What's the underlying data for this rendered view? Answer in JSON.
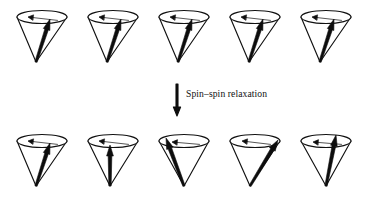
{
  "figure": {
    "background_color": "#ffffff",
    "ink_color": "#111111",
    "width": 378,
    "height": 200
  },
  "transition": {
    "label": "Spin–spin relaxation",
    "arrow_icon": "down-arrow-icon",
    "arrow_direction": "down",
    "arrow_x": 177,
    "arrow_y_start": 84,
    "arrow_y_end": 116,
    "label_x": 186,
    "label_y": 97
  },
  "rows": [
    {
      "id": "top-row",
      "name": "in-phase-spins-row",
      "description": "Magnetization vectors precessing in phase",
      "center_y": 17,
      "apex_y": 62,
      "cones": [
        {
          "id": "top-cone-1",
          "label": "Cone 1",
          "cx": 42,
          "rx": 25,
          "ry": 6.5,
          "apex_x": 36,
          "vector_tip_x": 50,
          "vector_tip_y": 19,
          "vector_phase_deg": 18,
          "precession_arrow_tip_x": 28,
          "precession_arrow_tip_y": 17
        },
        {
          "id": "top-cone-2",
          "label": "Cone 2",
          "cx": 113,
          "rx": 25,
          "ry": 6.5,
          "apex_x": 107,
          "vector_tip_x": 121,
          "vector_tip_y": 19,
          "vector_phase_deg": 18,
          "precession_arrow_tip_x": 99,
          "precession_arrow_tip_y": 17
        },
        {
          "id": "top-cone-3",
          "label": "Cone 3",
          "cx": 184,
          "rx": 25,
          "ry": 6.5,
          "apex_x": 178,
          "vector_tip_x": 192,
          "vector_tip_y": 19,
          "vector_phase_deg": 18,
          "precession_arrow_tip_x": 170,
          "precession_arrow_tip_y": 17
        },
        {
          "id": "top-cone-4",
          "label": "Cone 4",
          "cx": 255,
          "rx": 25,
          "ry": 6.5,
          "apex_x": 249,
          "vector_tip_x": 263,
          "vector_tip_y": 19,
          "vector_phase_deg": 18,
          "precession_arrow_tip_x": 241,
          "precession_arrow_tip_y": 17
        },
        {
          "id": "top-cone-5",
          "label": "Cone 5",
          "cx": 326,
          "rx": 25,
          "ry": 6.5,
          "apex_x": 320,
          "vector_tip_x": 334,
          "vector_tip_y": 19,
          "vector_phase_deg": 18,
          "precession_arrow_tip_x": 312,
          "precession_arrow_tip_y": 17
        }
      ]
    },
    {
      "id": "bottom-row",
      "name": "dephased-spins-row",
      "description": "Magnetization vectors dephased after spin-spin relaxation",
      "center_y": 141,
      "apex_y": 186,
      "cones": [
        {
          "id": "bottom-cone-1",
          "label": "Cone 1",
          "cx": 42,
          "rx": 25,
          "ry": 6.5,
          "apex_x": 36,
          "vector_tip_x": 50,
          "vector_tip_y": 143,
          "vector_phase_deg": 20,
          "precession_arrow_tip_x": 28,
          "precession_arrow_tip_y": 141
        },
        {
          "id": "bottom-cone-2",
          "label": "Cone 2",
          "cx": 113,
          "rx": 25,
          "ry": 6.5,
          "apex_x": 110,
          "vector_tip_x": 110,
          "vector_tip_y": 145,
          "vector_phase_deg": 90,
          "precession_arrow_tip_x": 99,
          "precession_arrow_tip_y": 141
        },
        {
          "id": "bottom-cone-3",
          "label": "Cone 3",
          "cx": 184,
          "rx": 25,
          "ry": 6.5,
          "apex_x": 184,
          "vector_tip_x": 166,
          "vector_tip_y": 138,
          "vector_phase_deg": 160,
          "precession_arrow_tip_x": 172,
          "precession_arrow_tip_y": 142
        },
        {
          "id": "bottom-cone-4",
          "label": "Cone 4",
          "cx": 255,
          "rx": 25,
          "ry": 6.5,
          "apex_x": 250,
          "vector_tip_x": 278,
          "vector_tip_y": 140,
          "vector_phase_deg": 2,
          "precession_arrow_tip_x": 242,
          "precession_arrow_tip_y": 141
        },
        {
          "id": "bottom-cone-5",
          "label": "Cone 5",
          "cx": 326,
          "rx": 25,
          "ry": 6.5,
          "apex_x": 326,
          "vector_tip_x": 336,
          "vector_tip_y": 135,
          "vector_phase_deg": 60,
          "precession_arrow_tip_x": 313,
          "precession_arrow_tip_y": 142
        }
      ]
    }
  ]
}
